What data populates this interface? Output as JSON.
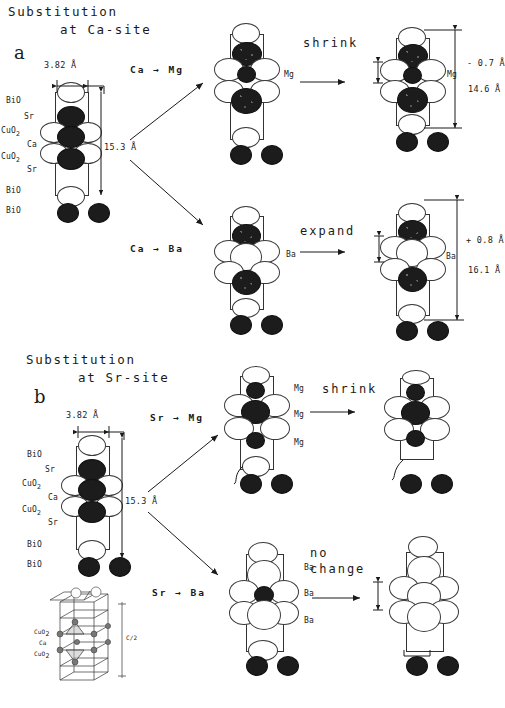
{
  "figure": {
    "caption_a_line1": "Substitution",
    "caption_a_line2": "at Ca-site",
    "caption_b_line1": "Substitution",
    "caption_b_line2": "at Sr-site",
    "panel_a_letter": "a",
    "panel_b_letter": "b"
  },
  "parent": {
    "width_dim": "3.82 Å",
    "height_dim": "15.3 Å",
    "layers": [
      "BiO",
      "Sr",
      "CuO2",
      "Ca",
      "CuO2",
      "Sr",
      "BiO",
      "BiO"
    ],
    "layer_labels": {
      "bio_top": "BiO",
      "sr_top": "Sr",
      "cuo2_top": "CuO2",
      "ca": "Ca",
      "cuo2_bottom": "CuO2",
      "sr_bottom": "Sr",
      "bio_bottom": "BiO",
      "bio_extra": "BiO"
    }
  },
  "rows": [
    {
      "id": "ca-to-mg",
      "reaction": "Ca → Mg",
      "dopant": "Mg",
      "verb": "shrink",
      "delta": "- 0.7 Å",
      "result_dim": "14.6 Å",
      "middle_dopant_labels": [
        "Mg"
      ],
      "result_dopant_label": "Mg"
    },
    {
      "id": "ca-to-ba",
      "reaction": "Ca → Ba",
      "dopant": "Ba",
      "verb": "expand",
      "delta": "+ 0.8 Å",
      "result_dim": "16.1 Å",
      "middle_dopant_labels": [
        "Ba"
      ],
      "result_dopant_label": "Ba"
    },
    {
      "id": "sr-to-mg",
      "reaction": "Sr → Mg",
      "dopant": "Mg",
      "verb": "shrink",
      "delta": "",
      "result_dim": "",
      "middle_dopant_labels": [
        "Mg",
        "Mg",
        "Mg"
      ],
      "result_dopant_label": ""
    },
    {
      "id": "sr-to-ba",
      "reaction": "Sr → Ba",
      "dopant": "Ba",
      "verb_line1": "no",
      "verb_line2": "change",
      "delta": "",
      "result_dim": "",
      "middle_dopant_labels": [
        "Ba",
        "Ba",
        "Ba"
      ],
      "result_dopant_label": ""
    }
  ],
  "inset": {
    "labels": [
      "CuO2",
      "Ca",
      "CuO2"
    ],
    "axis_label": "C/2"
  },
  "colors": {
    "ink": "#1a1a1a",
    "atom_filled": "#1c1c1c",
    "atom_open": "#ffffff",
    "outline": "#333333"
  }
}
